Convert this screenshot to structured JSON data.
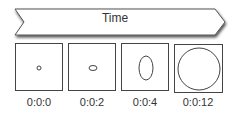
{
  "timeline": {
    "label": "Time",
    "shape": "chevron-arrow"
  },
  "frames": [
    {
      "time": "0:0:0",
      "shape": "circle",
      "rx": 2,
      "ry": 2
    },
    {
      "time": "0:0:2",
      "shape": "ellipse",
      "rx": 4,
      "ry": 2.5
    },
    {
      "time": "0:0:4",
      "shape": "ellipse",
      "rx": 7,
      "ry": 12
    },
    {
      "time": "0:0:12",
      "shape": "circle",
      "rx": 21,
      "ry": 21
    }
  ],
  "colors": {
    "stroke": "#444444",
    "text": "#333333",
    "background": "#ffffff"
  }
}
